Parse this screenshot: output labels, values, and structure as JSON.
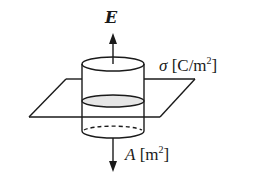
{
  "diagram": {
    "labels": {
      "field": "E",
      "surface_charge_symbol": "σ",
      "surface_charge_unit_open": " [C/m",
      "surface_charge_unit_exp": "2",
      "surface_charge_unit_close": "]",
      "area_symbol": "A",
      "area_unit_open": " [m",
      "area_unit_exp": "2",
      "area_unit_close": "]"
    },
    "elements": {
      "plane": "parallelogram representing charged sheet",
      "cylinder": "Gaussian pillbox surface",
      "cross_section": "shaded ellipse where plane cuts cylinder",
      "arrow_up": "field E upward",
      "arrow_down": "field downward through bottom face"
    },
    "colors": {
      "stroke": "#1a1a1a",
      "background": "#ffffff",
      "cross_section_fill": "#e6e6e6"
    }
  }
}
